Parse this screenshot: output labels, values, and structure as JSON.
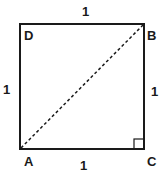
{
  "diagram": {
    "type": "geometry-square",
    "vertices": [
      {
        "name": "D",
        "label": "D"
      },
      {
        "name": "B",
        "label": "B"
      },
      {
        "name": "C",
        "label": "C"
      },
      {
        "name": "A",
        "label": "A"
      }
    ],
    "sides": {
      "top": "1",
      "left": "1",
      "right": "1",
      "bottom": "1"
    },
    "diagonal": {
      "from": "A",
      "to": "B",
      "style": "dashed"
    },
    "right_angle_at": "C",
    "colors": {
      "stroke": "#1a1a1a",
      "background": "#ffffff"
    }
  }
}
